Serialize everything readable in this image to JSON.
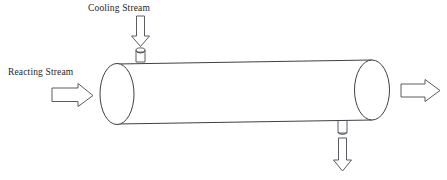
{
  "diagram": {
    "type": "process-flow-diagram",
    "canvas": {
      "width": 447,
      "height": 180,
      "background": "#ffffff"
    },
    "stroke_color": "#3f3f45",
    "labels": {
      "cooling_stream": "Cooling Stream",
      "reacting_stream": "Reacting Stream"
    },
    "vessel": {
      "name": "reactor-vessel",
      "shape": "horizontal-cylinder",
      "left_cap_center_x": 117,
      "left_cap_center_y": 94,
      "left_cap_rx": 17,
      "left_cap_ry": 30,
      "right_cap_center_x": 372,
      "right_cap_center_y": 90,
      "right_cap_rx": 17,
      "right_cap_ry": 30
    },
    "nozzles": [
      {
        "name": "cooling-inlet-nozzle",
        "position": "top",
        "x": 140,
        "y": 60
      },
      {
        "name": "cooling-outlet-nozzle",
        "position": "bottom",
        "x": 342,
        "y": 122
      }
    ],
    "arrows": [
      {
        "name": "reacting-stream-inlet-arrow",
        "direction": "right",
        "x": 52,
        "y": 95
      },
      {
        "name": "reacting-stream-outlet-arrow",
        "direction": "right",
        "x": 401,
        "y": 90
      },
      {
        "name": "cooling-stream-inlet-arrow",
        "direction": "down",
        "x": 140,
        "y": 16
      },
      {
        "name": "cooling-stream-outlet-arrow",
        "direction": "down",
        "x": 342,
        "y": 140
      }
    ]
  }
}
